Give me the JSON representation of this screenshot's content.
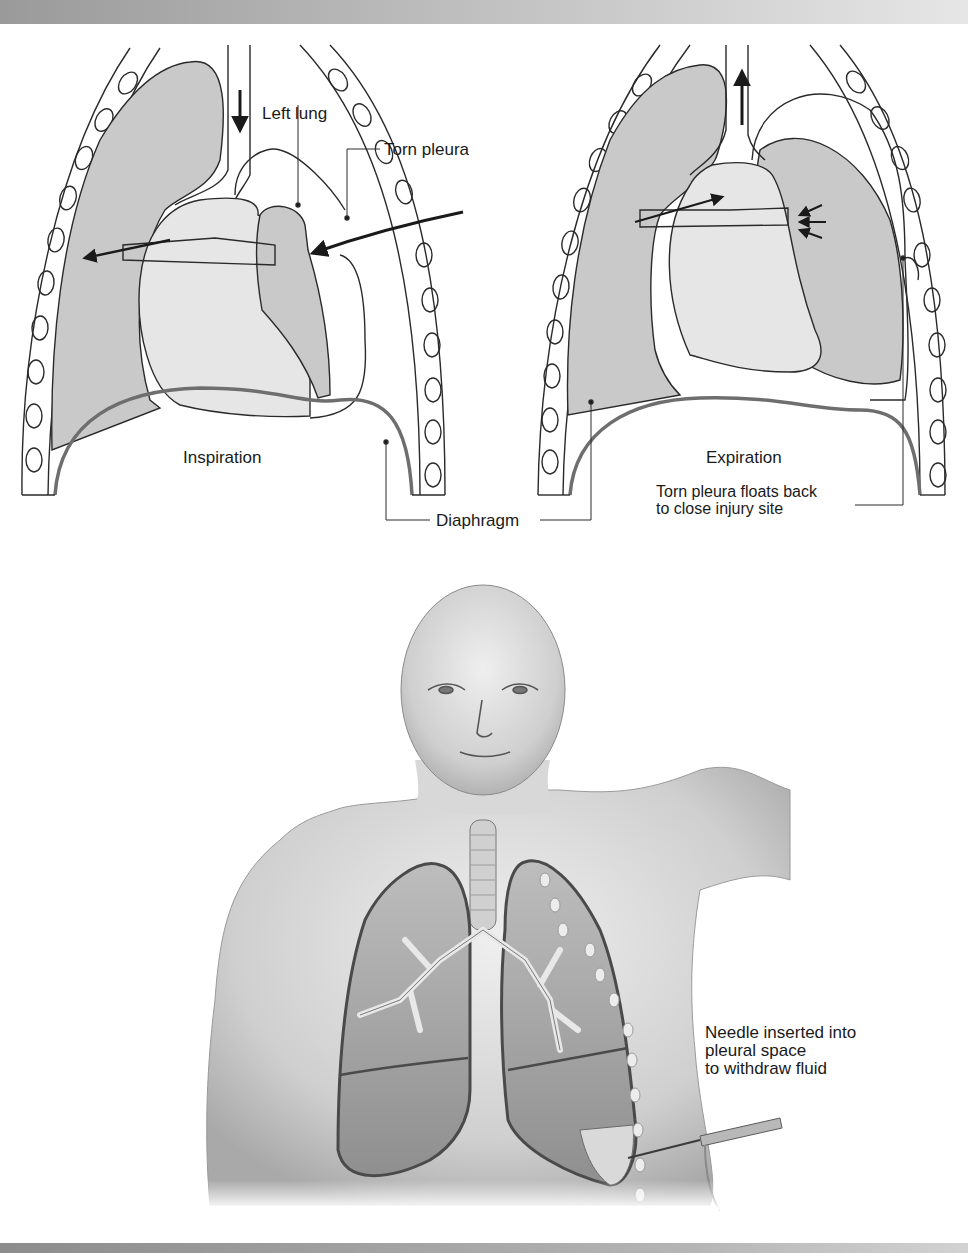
{
  "figure": {
    "top_panel": {
      "left_diagram": {
        "caption": "Inspiration",
        "labels": {
          "left_lung": "Left lung",
          "torn_pleura": "Torn pleura"
        }
      },
      "right_diagram": {
        "caption": "Expiration",
        "note_line1": "Torn pleura floats back",
        "note_line2": "to close injury site"
      },
      "shared_label": "Diaphragm"
    },
    "bottom_panel": {
      "callout_line1": "Needle inserted into",
      "callout_line2": "pleural space",
      "callout_line3": "to withdraw fluid"
    },
    "colors": {
      "lung_fill": "#c9c9c9",
      "mediastinum_fill": "#e6e6e6",
      "line": "#2a2a2a",
      "diaphragm": "#6e6e6e",
      "skin": "#d4d4d4"
    }
  }
}
